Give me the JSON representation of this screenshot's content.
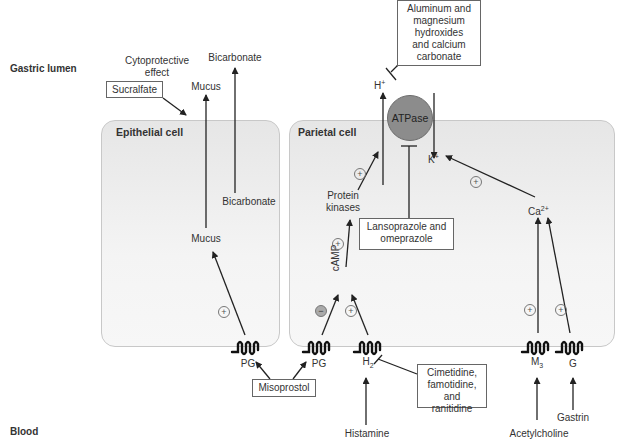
{
  "regions": {
    "top": "Gastric lumen",
    "bottom": "Blood"
  },
  "cells": {
    "epithelial": "Epithelial cell",
    "parietal": "Parietal cell"
  },
  "lumen_labels": {
    "cytoprotective_line1": "Cytoprotective",
    "cytoprotective_line2": "effect",
    "mucus": "Mucus",
    "bicarbonate": "Bicarbonate",
    "h_ion": "H",
    "h_charge": "+"
  },
  "epithelial_labels": {
    "mucus": "Mucus",
    "bicarbonate": "Bicarbonate"
  },
  "parietal_labels": {
    "atpase": "ATPase",
    "k_ion": "K",
    "k_charge": "+",
    "protein_kinases_line1": "Protein",
    "protein_kinases_line2": "kinases",
    "camp": "cAMP",
    "calcium": "Ca",
    "calcium_charge": "2+"
  },
  "receptors": [
    {
      "id": "pg-epithelial",
      "label": "PG"
    },
    {
      "id": "pg-parietal",
      "label": "PG"
    },
    {
      "id": "h2",
      "label": "H",
      "sub": "2"
    },
    {
      "id": "m3",
      "label": "M",
      "sub": "3"
    },
    {
      "id": "g",
      "label": "G"
    }
  ],
  "ligands": {
    "histamine": "Histamine",
    "acetylcholine": "Acetylcholine",
    "gastrin": "Gastrin"
  },
  "drugs": {
    "sucralfate": "Sucralfate",
    "antacids": [
      "Aluminum and",
      "magnesium",
      "hydroxides",
      "and calcium",
      "carbonate"
    ],
    "ppi": [
      "Lansoprazole and",
      "omeprazole"
    ],
    "misoprostol": "Misoprostol",
    "h2_blockers": [
      "Cimetidine,",
      "famotidine,",
      "and ranitidine"
    ]
  },
  "signs": {
    "plus": "+",
    "minus": "−"
  }
}
